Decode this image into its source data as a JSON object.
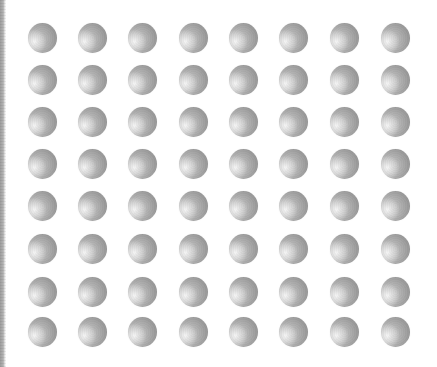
{
  "scene": {
    "description": "8x8 grid of shaded gray spheres on white background",
    "width": 437,
    "height": 367,
    "background": "#ffffff",
    "edge_strip_color": "#a0a0a0",
    "grid": {
      "rows": 8,
      "cols": 8,
      "col_centers": [
        42,
        92,
        142,
        193,
        243,
        293,
        344,
        395
      ],
      "row_centers": [
        37,
        79,
        121,
        163,
        205,
        248,
        291,
        331
      ],
      "sphere_diameter": 29,
      "light_direction": "lower-left",
      "highlight_color": "#f6f6f6",
      "mid_color": "#b2b2b2",
      "shadow_color": "#8a8a8a"
    }
  }
}
